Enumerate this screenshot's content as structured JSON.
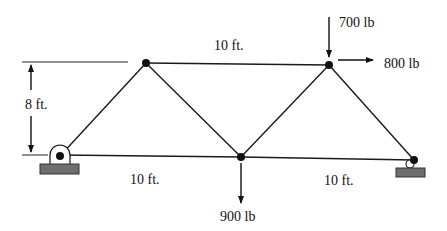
{
  "diagram": {
    "type": "truss",
    "colors": {
      "member": "#1a1a1a",
      "node": "#111111",
      "support_base": "#6e6e6e",
      "background": "#ffffff"
    },
    "nodes": [
      {
        "id": "A",
        "x": 60,
        "y": 156,
        "role": "pin-support"
      },
      {
        "id": "B",
        "x": 146,
        "y": 63,
        "role": "top-left"
      },
      {
        "id": "C",
        "x": 241,
        "y": 157,
        "role": "bottom-middle"
      },
      {
        "id": "D",
        "x": 329,
        "y": 65,
        "role": "top-right"
      },
      {
        "id": "E",
        "x": 414,
        "y": 160,
        "role": "roller-support"
      }
    ],
    "members": [
      [
        "A",
        "B"
      ],
      [
        "B",
        "C"
      ],
      [
        "C",
        "D"
      ],
      [
        "D",
        "E"
      ],
      [
        "B",
        "D"
      ],
      [
        "A",
        "C"
      ],
      [
        "C",
        "E"
      ]
    ],
    "dimensions": {
      "height_label": "8 ft.",
      "top_span_label": "10 ft.",
      "bottom_left_span_label": "10 ft.",
      "bottom_right_span_label": "10 ft."
    },
    "loads": [
      {
        "node": "D",
        "direction": "down",
        "label": "700 lb"
      },
      {
        "node": "D",
        "direction": "right",
        "label": "800 lb"
      },
      {
        "node": "C",
        "direction": "down",
        "label": "900 lb"
      }
    ]
  }
}
